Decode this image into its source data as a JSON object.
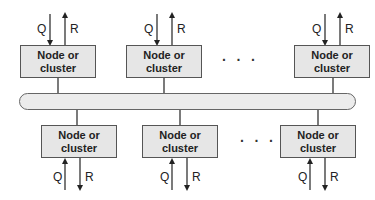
{
  "diagram": {
    "top_nodes": [
      {
        "label": "Node or\ncluster",
        "q": "Q",
        "r": "R"
      },
      {
        "label": "Node or\ncluster",
        "q": "Q",
        "r": "R"
      },
      {
        "label": "Node or\ncluster",
        "q": "Q",
        "r": "R"
      }
    ],
    "bottom_nodes": [
      {
        "label": "Node or\ncluster",
        "q": "Q",
        "r": "R"
      },
      {
        "label": "Node or\ncluster",
        "q": "Q",
        "r": "R"
      },
      {
        "label": "Node or\ncluster",
        "q": "Q",
        "r": "R"
      }
    ],
    "ellipsis": "· · ·",
    "bus": "interconnection-bus"
  }
}
